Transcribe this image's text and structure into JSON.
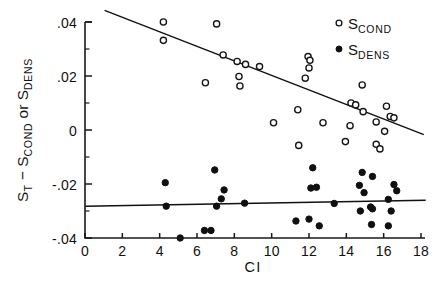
{
  "chart_data": {
    "type": "scatter",
    "title": "",
    "xlabel": "CI",
    "ylabel": "S_T - S_COND or S_DENS",
    "ylabel_parts": [
      {
        "main": "S",
        "sub": "T"
      },
      {
        "main": " − S",
        "sub": "COND"
      },
      {
        "main": " or S",
        "sub": "DENS"
      }
    ],
    "xlim": [
      0,
      18
    ],
    "ylim": [
      -0.04,
      0.04
    ],
    "xticks": [
      0,
      2,
      4,
      6,
      8,
      10,
      12,
      14,
      16,
      18
    ],
    "xticklabels": [
      "0",
      "2",
      "4",
      "6",
      "8",
      "10",
      "12",
      "14",
      "16",
      "18"
    ],
    "yticks": [
      -0.04,
      -0.02,
      0,
      0.02,
      0.04
    ],
    "yticklabels": [
      "-.04",
      "-.02",
      "0",
      ".02",
      ".04"
    ],
    "yminorticks": [
      -0.03,
      -0.01,
      0.01,
      0.03
    ],
    "grid": false,
    "legend_position": "top-right",
    "legend": [
      {
        "marker": "open-circle",
        "main": "S",
        "sub": "COND"
      },
      {
        "marker": "filled-circle",
        "main": "S",
        "sub": "DENS"
      }
    ],
    "series": [
      {
        "name": "S_COND",
        "marker": "open-circle",
        "points": [
          [
            4.2,
            0.04
          ],
          [
            4.2,
            0.0332
          ],
          [
            7.05,
            0.0393
          ],
          [
            7.4,
            0.0278
          ],
          [
            8.15,
            0.0254
          ],
          [
            8.6,
            0.0243
          ],
          [
            9.35,
            0.0235
          ],
          [
            6.45,
            0.0175
          ],
          [
            8.25,
            0.0198
          ],
          [
            8.3,
            0.0163
          ],
          [
            11.95,
            0.0272
          ],
          [
            12.05,
            0.0258
          ],
          [
            12.0,
            0.023
          ],
          [
            11.8,
            0.0192
          ],
          [
            11.4,
            0.0075
          ],
          [
            10.1,
            0.0027
          ],
          [
            12.75,
            0.0027
          ],
          [
            11.45,
            -0.0057
          ],
          [
            14.85,
            0.0167
          ],
          [
            14.25,
            0.01
          ],
          [
            14.5,
            0.0093
          ],
          [
            14.9,
            0.0068
          ],
          [
            16.15,
            0.0088
          ],
          [
            14.2,
            0.0016
          ],
          [
            15.6,
            0.003
          ],
          [
            16.35,
            0.005
          ],
          [
            16.55,
            0.0045
          ],
          [
            16.05,
            -0.0005
          ],
          [
            15.6,
            -0.0053
          ],
          [
            15.8,
            -0.007
          ],
          [
            13.95,
            -0.0043
          ]
        ]
      },
      {
        "name": "S_DENS",
        "marker": "filled-circle",
        "points": [
          [
            4.3,
            -0.0195
          ],
          [
            4.35,
            -0.0282
          ],
          [
            5.1,
            -0.04
          ],
          [
            6.4,
            -0.0372
          ],
          [
            6.75,
            -0.0372
          ],
          [
            6.95,
            -0.0148
          ],
          [
            7.45,
            -0.0222
          ],
          [
            7.3,
            -0.0255
          ],
          [
            7.05,
            -0.0282
          ],
          [
            8.55,
            -0.0271
          ],
          [
            12.2,
            -0.014
          ],
          [
            12.1,
            -0.0215
          ],
          [
            12.4,
            -0.0212
          ],
          [
            13.35,
            -0.0272
          ],
          [
            11.3,
            -0.0337
          ],
          [
            12.0,
            -0.033
          ],
          [
            12.55,
            -0.0355
          ],
          [
            14.85,
            -0.0157
          ],
          [
            14.7,
            -0.0205
          ],
          [
            14.95,
            -0.0232
          ],
          [
            15.4,
            -0.0172
          ],
          [
            15.3,
            -0.0285
          ],
          [
            14.75,
            -0.03
          ],
          [
            16.55,
            -0.0202
          ],
          [
            16.25,
            -0.0257
          ],
          [
            16.4,
            -0.03
          ],
          [
            15.35,
            -0.035
          ],
          [
            16.25,
            -0.0355
          ],
          [
            15.4,
            -0.0292
          ],
          [
            16.7,
            -0.0225
          ]
        ]
      }
    ],
    "fits": [
      {
        "name": "S_COND-fit",
        "x1": 1.05,
        "y1": 0.0443,
        "x2": 18.15,
        "y2": -0.0017
      },
      {
        "name": "S_DENS-fit",
        "x1": 0.0,
        "y1": -0.0282,
        "x2": 18.25,
        "y2": -0.026
      }
    ]
  }
}
